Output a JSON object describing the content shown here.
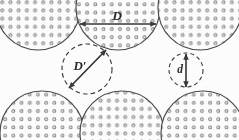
{
  "figure": {
    "name": "sphere-packing-void-diagram",
    "background_color": "#ffffff",
    "ink_color": "#3a3a3a",
    "dot_color": "#8a8a8a",
    "labels": [
      {
        "id": "D",
        "text": "D",
        "x": 117,
        "y": 20,
        "size": 13,
        "role": "large-sphere-diameter"
      },
      {
        "id": "Dp",
        "text": "D′",
        "x": 80,
        "y": 70,
        "size": 13,
        "role": "large-void-diameter"
      },
      {
        "id": "d",
        "text": "d",
        "x": 180,
        "y": 72,
        "size": 11,
        "role": "small-void-diameter"
      }
    ],
    "top_row_spheres": [
      {
        "cx": 38,
        "cy": 8,
        "r": 42
      },
      {
        "cx": 118,
        "cy": 8,
        "r": 42
      },
      {
        "cx": 200,
        "cy": 8,
        "r": 42
      }
    ],
    "bottom_row_spheres": [
      {
        "cx": 42,
        "cy": 133,
        "r": 42
      },
      {
        "cx": 122,
        "cy": 133,
        "r": 42
      },
      {
        "cx": 203,
        "cy": 133,
        "r": 42
      }
    ],
    "voids": [
      {
        "id": "Dp",
        "cx": 87,
        "cy": 69,
        "r": 25,
        "style": "dashed",
        "arrow": "diagonal"
      },
      {
        "id": "d",
        "cx": 186,
        "cy": 70,
        "r": 17,
        "style": "dashed",
        "arrow": "vertical"
      }
    ],
    "dimension_arrows": [
      {
        "id": "D-arrow",
        "x1": 78,
        "y1": 24,
        "x2": 158,
        "y2": 24,
        "orientation": "horizontal"
      },
      {
        "id": "Dp-arrow",
        "x1": 70,
        "y1": 88,
        "x2": 105,
        "y2": 50,
        "orientation": "diagonal"
      },
      {
        "id": "d-arrow",
        "x1": 186,
        "y1": 87,
        "x2": 186,
        "y2": 53,
        "orientation": "vertical"
      }
    ]
  }
}
